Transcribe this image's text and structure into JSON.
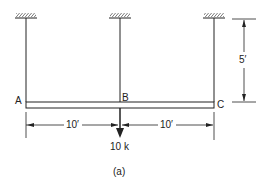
{
  "diagram": {
    "points": {
      "A": "A",
      "B": "B",
      "C": "C"
    },
    "dimensions": {
      "left_span": "10′",
      "right_span": "10′",
      "height": "5′"
    },
    "load": "10 k",
    "caption": "(a)",
    "colors": {
      "line": "#222222",
      "background": "#ffffff"
    }
  }
}
